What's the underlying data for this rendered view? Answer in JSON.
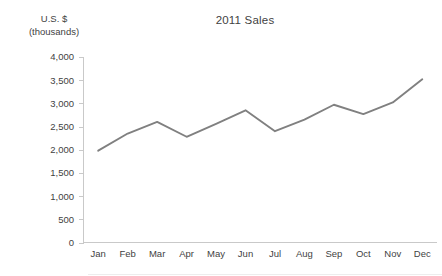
{
  "chart_data": {
    "type": "line",
    "title": "2011 Sales",
    "xlabel": "",
    "ylabel": "U.S. $ (thousands)",
    "ylabel_line1": "U.S. $",
    "ylabel_line2": "(thousands)",
    "categories": [
      "Jan",
      "Feb",
      "Mar",
      "Apr",
      "May",
      "Jun",
      "Jul",
      "Aug",
      "Sep",
      "Oct",
      "Nov",
      "Dec"
    ],
    "values": [
      1980,
      2350,
      2600,
      2280,
      2560,
      2850,
      2400,
      2650,
      2970,
      2770,
      3020,
      3520
    ],
    "series": [
      {
        "name": "2011 Sales",
        "values": [
          1980,
          2350,
          2600,
          2280,
          2560,
          2850,
          2400,
          2650,
          2970,
          2770,
          3020,
          3520
        ]
      }
    ],
    "ylim": [
      0,
      4000
    ],
    "y_ticks": [
      0,
      500,
      1000,
      1500,
      2000,
      2500,
      3000,
      3500,
      4000
    ],
    "y_tick_labels": [
      "0",
      "500",
      "1,000",
      "1,500",
      "2,000",
      "2,500",
      "3,000",
      "3,500",
      "4,000"
    ],
    "grid": false,
    "legend": "none",
    "line_color": "#808080",
    "axis_color": "#c9c9c9",
    "text_color": "#3f3f3f"
  }
}
